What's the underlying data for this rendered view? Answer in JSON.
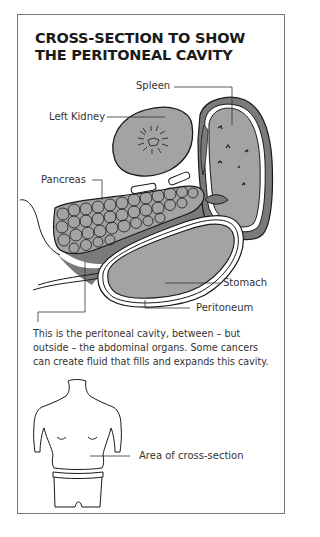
{
  "title": {
    "line1": "CROSS-SECTION TO SHOW",
    "line2": "THE PERITONEAL CAVITY"
  },
  "labels": {
    "spleen": "Spleen",
    "left_kidney": "Left Kidney",
    "pancreas": "Pancreas",
    "stomach": "Stomach",
    "peritoneum": "Peritoneum",
    "area_of_cross_section": "Area of cross-section"
  },
  "caption": "This is the peritoneal cavity, between – but outside – the abdominal organs. Some cancers can create fluid that fills and expands this cavity.",
  "colors": {
    "organ_fill": "#a3a3a3",
    "cavity_fill": "#7a7a7a",
    "outline": "#1a1a1a",
    "frame_border": "#777777"
  }
}
